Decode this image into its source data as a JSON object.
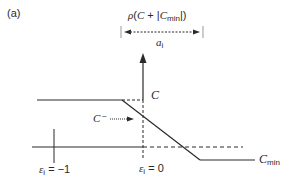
{
  "panel_label": "(a)",
  "top_formula": {
    "rho": "ρ",
    "open": "(",
    "C": "C",
    "plus": " + ",
    "bar_open": "|",
    "Cmin_base": "C",
    "Cmin_sub": "min",
    "bar_close": "|",
    "close": ")"
  },
  "width_label": {
    "base": "a",
    "sub": "i"
  },
  "labels": {
    "C": "C",
    "C_minus": "C⁻",
    "C_min_base": "C",
    "C_min_sub": "min",
    "eps_neg1_base": "ε",
    "eps_neg1_sub": "i",
    "eps_neg1_value": " = −1",
    "eps_0_base": "ε",
    "eps_0_sub": "i",
    "eps_0_value": " = 0"
  },
  "colors": {
    "line": "#2a2a2a",
    "background": "#ffffff"
  }
}
